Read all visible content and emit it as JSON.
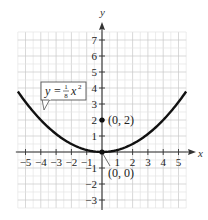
{
  "chart_data": {
    "type": "line",
    "title": "",
    "equation_label": "y = 1/8 x^2",
    "equation": {
      "y": "y =",
      "num": "1",
      "den": "8",
      "x": "x",
      "exp": "2"
    },
    "xlabel": "x",
    "ylabel": "y",
    "xlim": [
      -5.5,
      5.5
    ],
    "ylim": [
      -3.5,
      7.5
    ],
    "grid": true,
    "x_ticks": [
      "−5",
      "−4",
      "−3",
      "−2",
      "−1",
      "1",
      "2",
      "3",
      "4",
      "5"
    ],
    "y_ticks": [
      "7",
      "6",
      "5",
      "4",
      "3",
      "2",
      "1",
      "−1",
      "−2",
      "−3"
    ],
    "x_tick_values": [
      -5,
      -4,
      -3,
      -2,
      -1,
      1,
      2,
      3,
      4,
      5
    ],
    "y_tick_values": [
      7,
      6,
      5,
      4,
      3,
      2,
      1,
      -1,
      -2,
      -3
    ],
    "series": [
      {
        "name": "y = x^2/8",
        "function": "x*x/8",
        "x_range": [
          -5.5,
          5.5
        ],
        "x": [
          -5.5,
          -5,
          -4,
          -3,
          -2,
          -1,
          0,
          1,
          2,
          3,
          4,
          5,
          5.5
        ],
        "y": [
          3.78,
          3.125,
          2,
          1.125,
          0.5,
          0.125,
          0,
          0.125,
          0.5,
          1.125,
          2,
          3.125,
          3.78
        ]
      }
    ],
    "points": [
      {
        "label": "(0, 2)",
        "x": 0,
        "y": 2,
        "note": "focus"
      },
      {
        "label": "(0, 0)",
        "x": 0,
        "y": 0,
        "note": "vertex"
      }
    ]
  }
}
